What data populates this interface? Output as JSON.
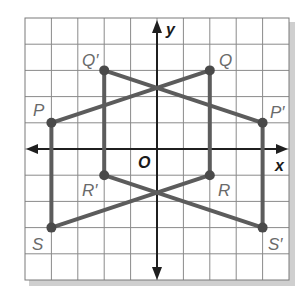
{
  "diagram": {
    "type": "coordinate-plane-reflection",
    "grid": {
      "xmin": -5,
      "xmax": 5,
      "ymin": -5,
      "ymax": 5,
      "step": 1,
      "show_grid": true
    },
    "axes": {
      "x_label": "x",
      "y_label": "y",
      "origin_label": "O"
    },
    "colors": {
      "grid": "#8a8a8a",
      "axis": "#1f1f1f",
      "figure": "#5c5c5c",
      "point": "#4a4a4a",
      "label": "#6a6a6a",
      "shadow": "#9a9a9a"
    },
    "points": [
      {
        "name": "P",
        "label": "P",
        "x": -4,
        "y": 1
      },
      {
        "name": "Q",
        "label": "Q",
        "x": 2,
        "y": 3
      },
      {
        "name": "R",
        "label": "R",
        "x": 2,
        "y": -1
      },
      {
        "name": "S",
        "label": "S",
        "x": -4,
        "y": -3
      },
      {
        "name": "P'",
        "label": "P′",
        "x": 4,
        "y": 1
      },
      {
        "name": "Q'",
        "label": "Q′",
        "x": -2,
        "y": 3
      },
      {
        "name": "R'",
        "label": "R′",
        "x": -2,
        "y": -1
      },
      {
        "name": "S'",
        "label": "S′",
        "x": 4,
        "y": -3
      }
    ],
    "figures": [
      {
        "name": "PQRS",
        "vertices": [
          "P",
          "Q",
          "R",
          "S"
        ]
      },
      {
        "name": "P'Q'R'S'",
        "vertices": [
          "P'",
          "Q'",
          "R'",
          "S'"
        ]
      }
    ]
  },
  "labels": {
    "P": "P",
    "Q": "Q",
    "R": "R",
    "S": "S",
    "Pp": "P′",
    "Qp": "Q′",
    "Rp": "R′",
    "Sp": "S′",
    "x": "x",
    "y": "y",
    "O": "O"
  }
}
